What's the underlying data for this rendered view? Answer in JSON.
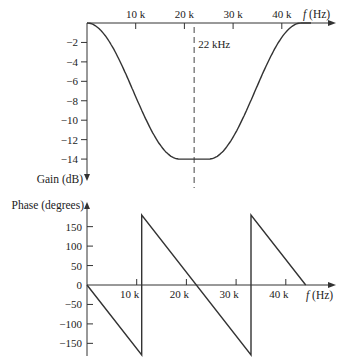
{
  "chart_data": [
    {
      "type": "line",
      "title": "",
      "xlabel": "f (Hz)",
      "ylabel": "Gain (dB)",
      "xlim": [
        0,
        45000
      ],
      "ylim": [
        -15,
        0
      ],
      "x_ticks": [
        10000,
        20000,
        30000,
        40000
      ],
      "x_tick_labels": [
        "10 k",
        "20 k",
        "30 k",
        "40 k"
      ],
      "y_ticks": [
        -2,
        -4,
        -6,
        -8,
        -10,
        -12,
        -14
      ],
      "y_tick_labels": [
        "−2",
        "−4",
        "−6",
        "−8",
        "−10",
        "−12",
        "−14"
      ],
      "grid": false,
      "annotations": [
        {
          "text": "22 kHz",
          "x": 22000,
          "style": "dashed vertical line"
        }
      ],
      "series": [
        {
          "name": "Gain",
          "x": [
            0,
            2000,
            4000,
            6000,
            8000,
            10000,
            12000,
            14000,
            16000,
            18000,
            19000,
            22000,
            25000,
            26000,
            28000,
            30000,
            32000,
            34000,
            36000,
            38000,
            40000,
            42000,
            44000
          ],
          "values": [
            0,
            -0.2,
            -0.9,
            -2.0,
            -3.6,
            -5.5,
            -7.6,
            -9.7,
            -11.6,
            -13.2,
            -14,
            -14,
            -14,
            -13.2,
            -11.6,
            -9.7,
            -7.6,
            -5.5,
            -3.6,
            -2.0,
            -0.9,
            -0.2,
            0
          ]
        }
      ]
    },
    {
      "type": "line",
      "title": "",
      "xlabel": "f (Hz)",
      "ylabel": "Phase (degrees)",
      "xlim": [
        0,
        45000
      ],
      "ylim": [
        -180,
        180
      ],
      "x_ticks": [
        10000,
        20000,
        30000,
        40000
      ],
      "x_tick_labels": [
        "10 k",
        "20 k",
        "30 k",
        "40 k"
      ],
      "y_ticks": [
        150,
        100,
        50,
        0,
        -50,
        -100,
        -150
      ],
      "y_tick_labels": [
        "150",
        "100",
        "50",
        "0",
        "−50",
        "−100",
        "−150"
      ],
      "grid": false,
      "series": [
        {
          "name": "Phase",
          "x": [
            0,
            11000,
            11000,
            33000,
            33000,
            44000
          ],
          "values": [
            0,
            -180,
            180,
            -180,
            180,
            0
          ]
        }
      ]
    }
  ],
  "gain_plot": {
    "x_axis_label": "f (Hz)",
    "y_axis_label": "Gain (dB)",
    "annotation": "22 kHz",
    "x_tick_labels": [
      "10 k",
      "20 k",
      "30 k",
      "40 k"
    ],
    "y_tick_labels": [
      "−2",
      "−4",
      "−6",
      "−8",
      "−10",
      "−12",
      "−14"
    ]
  },
  "phase_plot": {
    "x_axis_label": "f (Hz)",
    "y_axis_label": "Phase (degrees)",
    "x_tick_labels": [
      "10 k",
      "20 k",
      "30 k",
      "40 k"
    ],
    "y_tick_labels": [
      "150",
      "100",
      "50",
      "0",
      "−50",
      "−100",
      "−150"
    ]
  }
}
